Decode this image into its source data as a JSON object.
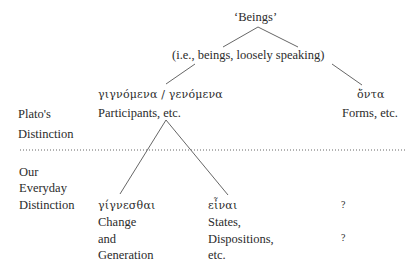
{
  "diagram": {
    "root": {
      "label": "‘Beings’"
    },
    "level1": {
      "label": "(i.e., beings, loosely speaking)"
    },
    "plato_left": {
      "greek": "γιγνόμενα / γενόμενα",
      "english": "Participants, etc."
    },
    "plato_right": {
      "greek": "ὄντα",
      "english": "Forms, etc."
    },
    "row_labels": {
      "plato": [
        "Plato's",
        "Distinction"
      ],
      "everyday": [
        "Our",
        "Everyday",
        "Distinction"
      ]
    },
    "everyday_left": {
      "greek": "γίγνεσθαι",
      "lines": [
        "Change",
        "and",
        "Generation"
      ]
    },
    "everyday_middle": {
      "greek": "εἶναι",
      "lines": [
        "States,",
        "Dispositions,",
        "etc."
      ]
    },
    "everyday_right": {
      "marks": [
        "?",
        "?"
      ]
    },
    "separator": {
      "style": "dotted"
    }
  }
}
